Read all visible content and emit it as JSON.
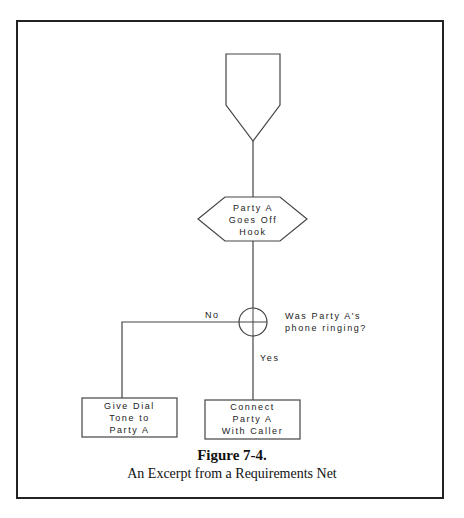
{
  "diagram": {
    "type": "requirements-net",
    "nodes": {
      "entry": {
        "shape": "pentagon-down",
        "label": ""
      },
      "event": {
        "shape": "hexagon",
        "label": "Party A\nGoes Off\nHook"
      },
      "decision": {
        "shape": "circle-cross",
        "label": "Was Party A's\nphone ringing?"
      },
      "no_action": {
        "shape": "rectangle",
        "label": "Give Dial\nTone to\nParty A"
      },
      "yes_action": {
        "shape": "rectangle",
        "label": "Connect\nParty A\nWith Caller"
      }
    },
    "edges": {
      "no_label": "No",
      "yes_label": "Yes"
    }
  },
  "caption": {
    "title": "Figure 7-4.",
    "subtitle": "An Excerpt from a Requirements Net"
  }
}
